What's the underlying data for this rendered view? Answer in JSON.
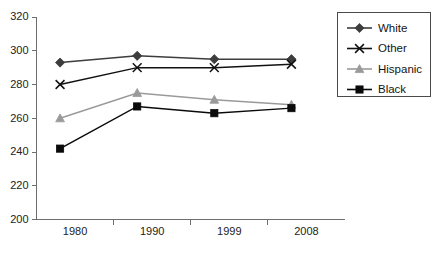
{
  "chart_data": {
    "type": "line",
    "title": "",
    "xlabel": "",
    "ylabel": "",
    "categories": [
      "1980",
      "1990",
      "1999",
      "2008"
    ],
    "ylim": [
      200,
      320
    ],
    "yticks": [
      200,
      220,
      240,
      260,
      280,
      300,
      320
    ],
    "grid": false,
    "legend_position": "top-right",
    "series": [
      {
        "name": "White",
        "marker": "diamond",
        "color": "#3d3d3d",
        "values": [
          293,
          297,
          295,
          295
        ]
      },
      {
        "name": "Other",
        "marker": "x",
        "color": "#111111",
        "values": [
          280,
          290,
          290,
          292
        ]
      },
      {
        "name": "Hispanic",
        "marker": "triangle",
        "color": "#9a9a9a",
        "values": [
          260,
          275,
          271,
          268
        ]
      },
      {
        "name": "Black",
        "marker": "square",
        "color": "#0a0a0a",
        "values": [
          242,
          267,
          263,
          266
        ]
      }
    ]
  },
  "axes": {
    "y_tick_labels": [
      "320",
      "300",
      "280",
      "260",
      "240",
      "220",
      "200"
    ],
    "x_tick_labels": [
      "1980",
      "1990",
      "1999",
      "2008"
    ]
  },
  "legend": {
    "items": [
      {
        "label": "White",
        "marker": "diamond",
        "color": "#3d3d3d"
      },
      {
        "label": "Other",
        "marker": "x",
        "color": "#111111"
      },
      {
        "label": "Hispanic",
        "marker": "triangle",
        "color": "#9a9a9a"
      },
      {
        "label": "Black",
        "marker": "square",
        "color": "#0a0a0a"
      }
    ]
  },
  "footer": {
    "caption": ""
  }
}
